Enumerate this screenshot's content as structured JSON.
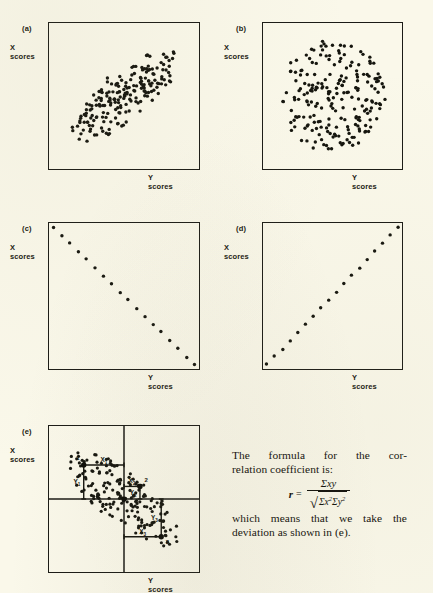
{
  "page": {
    "background_color": "#faf8ea",
    "ink_color": "#15150e",
    "width": 433,
    "height": 593
  },
  "axis_labels": {
    "x_axis": "Y  scores",
    "y_axis": "X\nscores"
  },
  "panels": [
    {
      "tag": "(a)",
      "caption_x": "Y  scores",
      "caption_y": "X\nscores",
      "box": {
        "x": 48,
        "y": 22,
        "w": 152,
        "h": 148
      },
      "tag_pos": {
        "x": 22,
        "y": 24
      },
      "ylab_pos": {
        "x": 10,
        "y": 44
      },
      "xlab_pos": {
        "x": 148,
        "y": 174
      },
      "chart_data": {
        "type": "scatter",
        "title": "(a) High positive correlation",
        "xlabel": "Y scores",
        "ylabel": "X scores",
        "correlation": 0.85,
        "n_points": 200,
        "shape": "ellipse-positive",
        "seed": 11,
        "ellipse": {
          "cx": 0.5,
          "cy": 0.5,
          "semi_major": 0.46,
          "semi_minor": 0.16,
          "angle_deg": -40
        },
        "dot_radius": 1.7
      }
    },
    {
      "tag": "(b)",
      "caption_x": "Y  scores",
      "caption_y": "X\nscores",
      "box": {
        "x": 262,
        "y": 22,
        "w": 141,
        "h": 148
      },
      "tag_pos": {
        "x": 236,
        "y": 24
      },
      "ylab_pos": {
        "x": 224,
        "y": 44
      },
      "xlab_pos": {
        "x": 352,
        "y": 174
      },
      "chart_data": {
        "type": "scatter",
        "title": "(b) Zero correlation",
        "xlabel": "Y scores",
        "ylabel": "X scores",
        "correlation": 0.0,
        "n_points": 215,
        "shape": "circle-uniform",
        "seed": 23,
        "ellipse": {
          "cx": 0.5,
          "cy": 0.5,
          "semi_major": 0.38,
          "semi_minor": 0.38,
          "angle_deg": 0
        },
        "dot_radius": 1.7
      }
    },
    {
      "tag": "(c)",
      "caption_x": "Y  scores",
      "caption_y": "X\nscores",
      "box": {
        "x": 48,
        "y": 222,
        "w": 152,
        "h": 148
      },
      "tag_pos": {
        "x": 22,
        "y": 224
      },
      "ylab_pos": {
        "x": 10,
        "y": 244
      },
      "xlab_pos": {
        "x": 148,
        "y": 374
      },
      "chart_data": {
        "type": "scatter",
        "title": "(c) Perfect negative correlation",
        "xlabel": "Y scores",
        "ylabel": "X scores",
        "correlation": -1.0,
        "n_points": 18,
        "shape": "line-negative",
        "seed": 5,
        "dot_radius": 1.7
      }
    },
    {
      "tag": "(d)",
      "caption_x": "Y  scores",
      "caption_y": "X\nscores",
      "box": {
        "x": 262,
        "y": 222,
        "w": 141,
        "h": 148
      },
      "tag_pos": {
        "x": 236,
        "y": 224
      },
      "ylab_pos": {
        "x": 224,
        "y": 244
      },
      "xlab_pos": {
        "x": 352,
        "y": 374
      },
      "chart_data": {
        "type": "scatter",
        "title": "(d) Perfect positive correlation",
        "xlabel": "Y scores",
        "ylabel": "X scores",
        "correlation": 1.0,
        "n_points": 18,
        "shape": "line-positive",
        "seed": 7,
        "dot_radius": 1.7
      }
    },
    {
      "tag": "(e)",
      "caption_x": "Y  scores",
      "caption_y": "X\nscores",
      "box": {
        "x": 48,
        "y": 425,
        "w": 152,
        "h": 148
      },
      "tag_pos": {
        "x": 22,
        "y": 427
      },
      "ylab_pos": {
        "x": 10,
        "y": 447
      },
      "xlab_pos": {
        "x": 148,
        "y": 577
      },
      "chart_data": {
        "type": "scatter",
        "title": "(e) Negative correlation with deviation scores",
        "xlabel": "Y scores",
        "ylabel": "X scores",
        "correlation": -0.8,
        "n_points": 185,
        "shape": "ellipse-negative",
        "seed": 31,
        "ellipse": {
          "cx": 0.5,
          "cy": 0.5,
          "semi_major": 0.46,
          "semi_minor": 0.17,
          "angle_deg": 40
        },
        "dot_radius": 1.6,
        "quadrant_lines": {
          "mean_x": 0.5,
          "mean_y": 0.5
        },
        "mean_point": {
          "x": 0.5,
          "y": 0.5,
          "radius": 2.6
        },
        "annotated_points": [
          {
            "number": "1",
            "x": 0.235,
            "y": 0.27,
            "x_label": "X",
            "x_sub": "1",
            "y_label": "Y",
            "y_sub": "1"
          },
          {
            "number": "2",
            "x": 0.605,
            "y": 0.415,
            "x_label": "X",
            "x_sub": "2",
            "y_label": "Y",
            "y_sub": "2"
          },
          {
            "number": "3",
            "x": 0.745,
            "y": 0.755,
            "x_label": "X",
            "x_sub": "3",
            "y_label": "Y",
            "y_sub": "3"
          }
        ]
      }
    }
  ],
  "text_block": {
    "line1_words": [
      "The",
      "formula",
      "for",
      "the",
      "cor-"
    ],
    "line2": "relation coefficient is:",
    "formula": {
      "symbol": "r",
      "equals": "=",
      "numerator": "Σxy",
      "denominator_a": "Σx",
      "denominator_a_exp": "2",
      "denominator_b": "Σy",
      "denominator_b_exp": "2",
      "radical": "√",
      "plain": "r = Σxy / √(Σx²Σy²)"
    },
    "line3_words": [
      "which",
      "means",
      "that",
      "we",
      "take",
      "the"
    ],
    "line4": "deviation as shown in (e)."
  }
}
